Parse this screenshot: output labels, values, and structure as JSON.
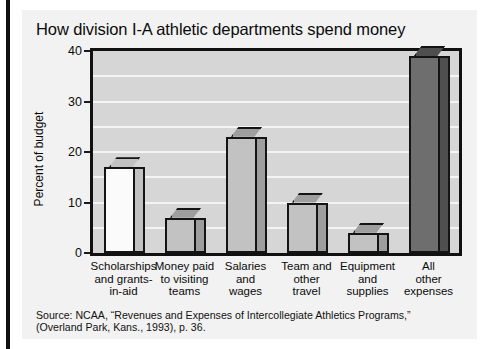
{
  "left_rule": "",
  "source": {
    "line1": "Source: NCAA, “Revenues and Expenses of Intercollegiate Athletics Programs,”",
    "line2": "(Overland Park, Kans., 1993), p. 36."
  },
  "chart_data": {
    "type": "bar",
    "title": "How division I-A athletic departments spend money",
    "xlabel": "",
    "ylabel": "Percent of budget",
    "ylim": [
      0,
      40
    ],
    "yticks": [
      0,
      10,
      20,
      30,
      40
    ],
    "ytick_labels": [
      "0",
      "10",
      "20",
      "30",
      "40"
    ],
    "gridlines": [
      5,
      10,
      15,
      20,
      25,
      30,
      35
    ],
    "grid": true,
    "legend": "none",
    "categories": [
      "Scholarships\nand grants-\nin-aid",
      "Money paid\nto visiting\nteams",
      "Salaries\nand\nwages",
      "Team and\nother\ntravel",
      "Equipment\nand\nsupplies",
      "All\nother\nexpenses"
    ],
    "category_lines": [
      [
        "Scholarships",
        "and grants-",
        "in-aid"
      ],
      [
        "Money paid",
        "to visiting",
        "teams"
      ],
      [
        "Salaries",
        "and",
        "wages"
      ],
      [
        "Team and",
        "other",
        "travel"
      ],
      [
        "Equipment",
        "and",
        "supplies"
      ],
      [
        "All",
        "other",
        "expenses"
      ]
    ],
    "values": [
      17,
      7,
      23,
      10,
      4,
      39
    ],
    "bar_colors": [
      "#fbfbfb",
      "#c2c2c2",
      "#c2c2c2",
      "#c2c2c2",
      "#c2c2c2",
      "#6e6e6e"
    ],
    "bar_side_colors": [
      "#c2c2c2",
      "#9e9e9e",
      "#9e9e9e",
      "#9e9e9e",
      "#9e9e9e",
      "#4f4f4f"
    ],
    "plot_background": "#d6d6d6",
    "gridline_color": "#f4f4f4",
    "frame_color": "#111111",
    "panel_color": "#f2f2f2"
  }
}
